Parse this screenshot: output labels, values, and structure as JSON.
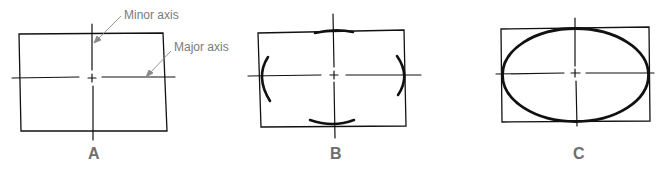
{
  "figure": {
    "panels": [
      {
        "caption": "A",
        "stage": "bounding-rectangle-with-axes"
      },
      {
        "caption": "B",
        "stage": "arcs-at-axis-ends"
      },
      {
        "caption": "C",
        "stage": "completed-ellipse"
      }
    ],
    "annotations": {
      "minor_axis": "Minor axis",
      "major_axis": "Major axis"
    },
    "colors": {
      "line": "#111111",
      "annotation": "#7a7a7a",
      "caption": "#6e6e6e"
    }
  }
}
